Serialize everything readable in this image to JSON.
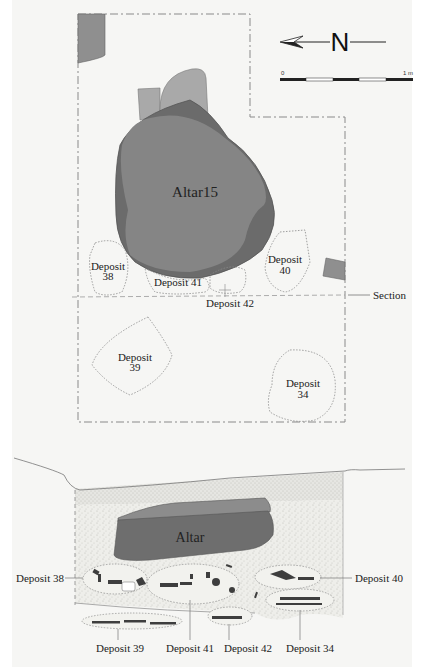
{
  "north_arrow": {
    "label": "N",
    "icon": "north-arrow-icon"
  },
  "scale_bar": {
    "start_label": "0",
    "end_label": "1 m"
  },
  "plan": {
    "altar_label": "Altar15",
    "deposits": [
      {
        "id": "38",
        "line1": "Deposit",
        "line2": "38"
      },
      {
        "id": "40",
        "line1": "Deposit",
        "line2": "40"
      },
      {
        "id": "41",
        "label": "Deposit 41"
      },
      {
        "id": "42",
        "label": "Deposit 42"
      },
      {
        "id": "39",
        "line1": "Deposit",
        "line2": "39"
      },
      {
        "id": "34",
        "line1": "Deposit",
        "line2": "34"
      }
    ],
    "section_label": "Section"
  },
  "section": {
    "altar_label": "Altar",
    "callouts": {
      "left": "Deposit 38",
      "right": "Deposit 40",
      "bottom": [
        "Deposit 39",
        "Deposit 41",
        "Deposit 42",
        "Deposit 34"
      ]
    }
  },
  "colors": {
    "altar_dark": "#6e6e6e",
    "altar_main": "#8a8a8a",
    "stone_light": "#a8a8a8",
    "deposit_outline": "#777777",
    "background": "#f6f6f4"
  }
}
